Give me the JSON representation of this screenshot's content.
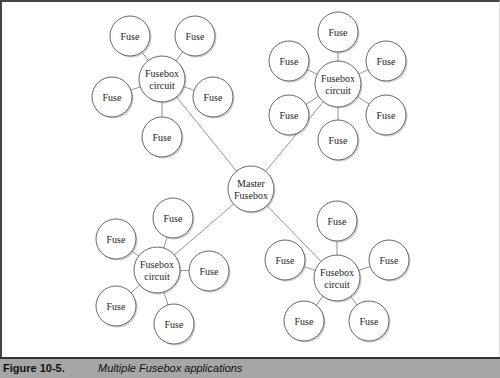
{
  "diagram": {
    "master": {
      "label": [
        "Master",
        "Fusebox"
      ],
      "x": 251,
      "y": 189,
      "r": 23
    },
    "clusters": [
      {
        "name": "top-left",
        "hub": {
          "label": [
            "Fusebox",
            "circuit"
          ],
          "x": 162,
          "y": 79,
          "r": 23
        },
        "fuses": [
          {
            "x": 130,
            "y": 36
          },
          {
            "x": 195,
            "y": 36
          },
          {
            "x": 112,
            "y": 97
          },
          {
            "x": 213,
            "y": 97
          },
          {
            "x": 162,
            "y": 137
          }
        ]
      },
      {
        "name": "top-right",
        "hub": {
          "label": [
            "Fusebox",
            "circuit"
          ],
          "x": 338,
          "y": 84,
          "r": 23
        },
        "fuses": [
          {
            "x": 338,
            "y": 32
          },
          {
            "x": 289,
            "y": 61
          },
          {
            "x": 386,
            "y": 61
          },
          {
            "x": 289,
            "y": 115
          },
          {
            "x": 386,
            "y": 115
          },
          {
            "x": 338,
            "y": 140
          }
        ]
      },
      {
        "name": "bottom-left",
        "hub": {
          "label": [
            "Fusebox",
            "circuit"
          ],
          "x": 157,
          "y": 270,
          "r": 23
        },
        "fuses": [
          {
            "x": 173,
            "y": 218
          },
          {
            "x": 116,
            "y": 239
          },
          {
            "x": 209,
            "y": 271
          },
          {
            "x": 116,
            "y": 306
          },
          {
            "x": 174,
            "y": 324
          }
        ]
      },
      {
        "name": "bottom-right",
        "hub": {
          "label": [
            "Fusebox",
            "circuit"
          ],
          "x": 337,
          "y": 278,
          "r": 23
        },
        "fuses": [
          {
            "x": 337,
            "y": 221
          },
          {
            "x": 285,
            "y": 260
          },
          {
            "x": 389,
            "y": 260
          },
          {
            "x": 304,
            "y": 321
          },
          {
            "x": 369,
            "y": 321
          }
        ]
      }
    ],
    "fuse_label": "Fuse",
    "fuse_r": 20
  },
  "caption": {
    "number": "Figure 10-5.",
    "title": "Multiple Fusebox applications"
  }
}
